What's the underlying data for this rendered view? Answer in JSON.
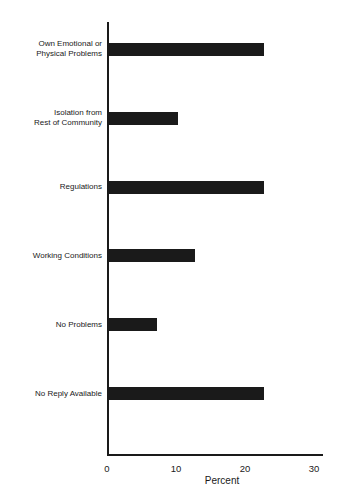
{
  "chart_data": {
    "type": "bar",
    "orientation": "horizontal",
    "title": "",
    "xlabel": "Percent",
    "ylabel": "",
    "xlim": [
      0,
      31
    ],
    "xticks": [
      0,
      10,
      20,
      30
    ],
    "grid": false,
    "categories": [
      "Own Emotional or Physical Problems",
      "Isolation from Rest of Community",
      "Regulations",
      "Working Conditions",
      "No Problems",
      "No Reply Available"
    ],
    "values": [
      22.5,
      10,
      22.5,
      12.5,
      7,
      22.5
    ],
    "bar_color": "#1a1a1a"
  },
  "labels": {
    "cat0_line1": "Own Emotional or",
    "cat0_line2": "Physical Problems",
    "cat1_line1": "Isolation from",
    "cat1_line2": "Rest of Community",
    "cat2": "Regulations",
    "cat3": "Working Conditions",
    "cat4": "No Problems",
    "cat5": "No Reply Available",
    "tick0": "0",
    "tick1": "10",
    "tick2": "20",
    "tick3": "30",
    "xtitle": "Percent"
  }
}
